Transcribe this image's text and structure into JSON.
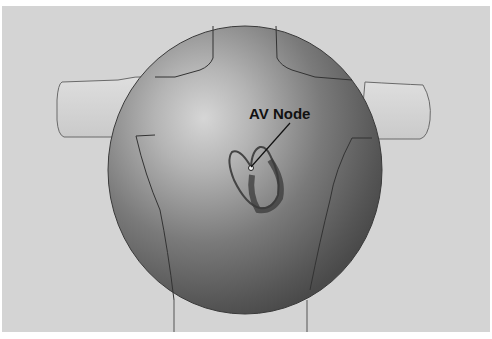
{
  "figure": {
    "type": "anatomical-diagram",
    "labels": [
      {
        "text": "AV Node",
        "target": "atrioventricular-node"
      }
    ],
    "colors": {
      "background": "#d4d4d4",
      "sphere_dark": "#4a4a4a",
      "sphere_light": "#cfcfcf",
      "outline": "#2a2a2a",
      "label": "#111111"
    }
  }
}
